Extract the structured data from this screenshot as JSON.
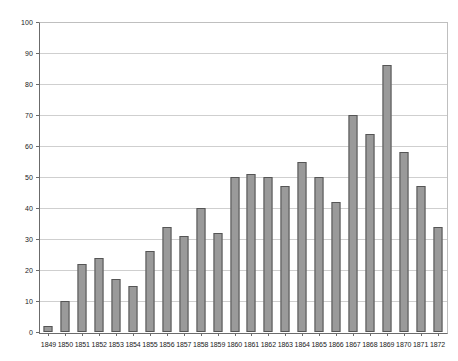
{
  "chart_data": {
    "type": "bar",
    "title": "",
    "subtitle": "",
    "xlabel": "",
    "ylabel": "",
    "ylim": [
      0,
      100
    ],
    "ytick_step": 10,
    "yticks": [
      0,
      10,
      20,
      30,
      40,
      50,
      60,
      70,
      80,
      90,
      100
    ],
    "grid": true,
    "legend": false,
    "legend_position": "none",
    "categories": [
      "1849",
      "1850",
      "1851",
      "1852",
      "1853",
      "1854",
      "1855",
      "1856",
      "1857",
      "1858",
      "1859",
      "1860",
      "1861",
      "1862",
      "1863",
      "1864",
      "1865",
      "1866",
      "1867",
      "1868",
      "1869",
      "1870",
      "1871",
      "1872"
    ],
    "values": [
      2,
      10,
      22,
      24,
      17,
      15,
      26,
      34,
      31,
      40,
      32,
      50,
      51,
      50,
      47,
      55,
      50,
      42,
      70,
      64,
      86,
      58,
      47,
      34
    ]
  },
  "style": {
    "bar_fill": "#9a9a9a",
    "bar_border": "#555555",
    "gridline_color": "#cfcfcf",
    "axis_color": "#6b6b6b",
    "label_color": "#1a1a1a",
    "background": "#ffffff"
  }
}
